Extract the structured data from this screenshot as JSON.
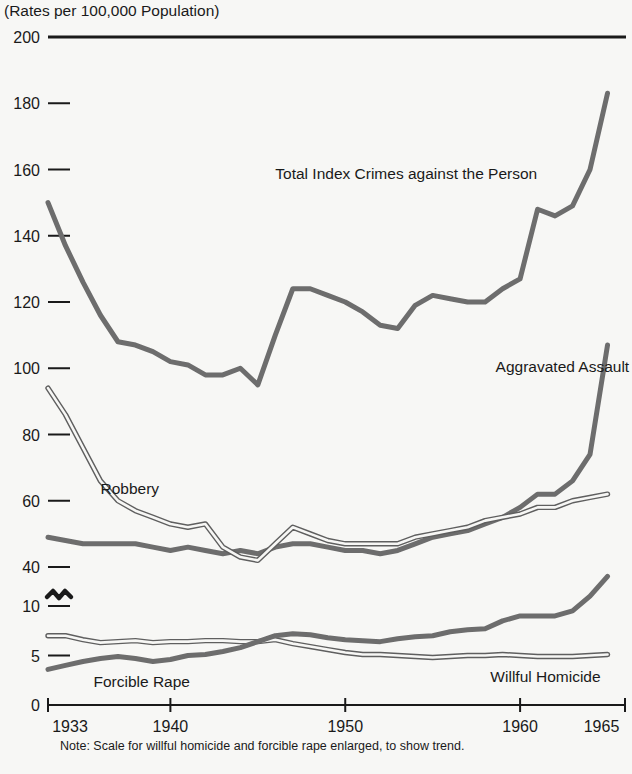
{
  "chart_data": {
    "type": "line",
    "title": "",
    "subtitle": "",
    "ylabel": "(Rates per 100,000 Population)",
    "xlabel": "",
    "note": "Note: Scale for willful homicide and forcible rape enlarged, to show trend.",
    "grid": false,
    "legend_position": "inline-annotations",
    "x": [
      1933,
      1934,
      1935,
      1936,
      1937,
      1938,
      1939,
      1940,
      1941,
      1942,
      1943,
      1944,
      1945,
      1946,
      1947,
      1948,
      1949,
      1950,
      1951,
      1952,
      1953,
      1954,
      1955,
      1956,
      1957,
      1958,
      1959,
      1960,
      1961,
      1962,
      1963,
      1964,
      1965
    ],
    "xlim": [
      1933,
      1966
    ],
    "x_tick_values": [
      1933,
      1940,
      1950,
      1960,
      1965
    ],
    "x_tick_labels": [
      "1933",
      "1940",
      "1950",
      "1960",
      "1965"
    ],
    "y_tick_values": [
      200,
      180,
      160,
      140,
      120,
      100,
      80,
      60,
      40
    ],
    "y_tick_labels": [
      "200",
      "180",
      "160",
      "140",
      "120",
      "100",
      "80",
      "60",
      "40"
    ],
    "y_tick_values_enlarged": [
      10,
      5,
      0
    ],
    "y_tick_labels_enlarged": [
      "10",
      "5",
      "0"
    ],
    "ylim": [
      0,
      200
    ],
    "axis_break": true,
    "axis_break_between": [
      40,
      10
    ],
    "series": [
      {
        "name": "Total Index Crimes against the Person",
        "style": "thick",
        "scale": "main",
        "label_x": 1946.0,
        "label_y": 157.0,
        "values": [
          150,
          137,
          126,
          116,
          108,
          107,
          105,
          102,
          101,
          98,
          98,
          100,
          95,
          110,
          124,
          124,
          122,
          120,
          117,
          113,
          112,
          119,
          122,
          121,
          120,
          120,
          124,
          127,
          148,
          146,
          149,
          160,
          183
        ]
      },
      {
        "name": "Aggravated Assault",
        "style": "thick",
        "scale": "main",
        "label_x": 1958.6,
        "label_y": 99.0,
        "values": [
          49,
          48,
          47,
          47,
          47,
          47,
          46,
          45,
          46,
          45,
          44,
          45,
          44,
          46,
          47,
          47,
          46,
          45,
          45,
          44,
          45,
          47,
          49,
          50,
          51,
          53,
          55,
          58,
          62,
          62,
          66,
          74,
          107
        ]
      },
      {
        "name": "Robbery",
        "style": "double",
        "scale": "main",
        "label_x": 1936.0,
        "label_y": 62.0,
        "values": [
          94,
          86,
          76,
          66,
          60,
          57,
          55,
          53,
          52,
          53,
          46,
          43,
          42,
          47,
          52,
          50,
          48,
          47,
          47,
          47,
          47,
          49,
          50,
          51,
          52,
          54,
          55,
          56,
          58,
          58,
          60,
          61,
          62
        ]
      },
      {
        "name": "Willful Homicide",
        "style": "double",
        "scale": "enlarged",
        "label_x": 1958.3,
        "label_y": 2.3,
        "values": [
          7.0,
          7.0,
          6.6,
          6.3,
          6.4,
          6.5,
          6.3,
          6.4,
          6.4,
          6.5,
          6.5,
          6.4,
          6.4,
          6.6,
          6.2,
          5.9,
          5.6,
          5.3,
          5.1,
          5.1,
          5.0,
          4.9,
          4.8,
          4.9,
          5.0,
          5.0,
          5.1,
          5.0,
          4.9,
          4.9,
          4.9,
          5.0,
          5.1
        ]
      },
      {
        "name": "Forcible Rape",
        "style": "thick",
        "scale": "enlarged",
        "label_x": 1935.6,
        "label_y": 1.8,
        "values": [
          3.6,
          4.0,
          4.4,
          4.7,
          4.9,
          4.7,
          4.4,
          4.6,
          5.0,
          5.1,
          5.4,
          5.8,
          6.4,
          7.0,
          7.2,
          7.1,
          6.8,
          6.6,
          6.5,
          6.4,
          6.7,
          6.9,
          7.0,
          7.4,
          7.6,
          7.7,
          8.5,
          9.0,
          9.0,
          9.0,
          9.5,
          11.0,
          13.0
        ]
      }
    ],
    "colors": {
      "background": "#f7f7f5",
      "axis": "#1a1a1a",
      "series_line": "#6d6d6d",
      "text": "#1a1a1a"
    }
  }
}
